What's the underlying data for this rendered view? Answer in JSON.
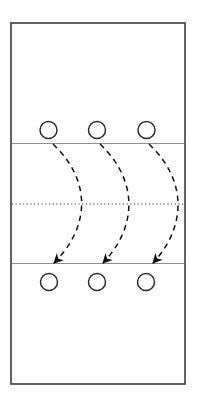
{
  "diagram": {
    "kind": "court-movement-diagram",
    "background": "#ffffff",
    "canvas": {
      "width": 197,
      "height": 402
    },
    "court": {
      "x": 11,
      "y": 23,
      "width": 174,
      "height": 361,
      "stroke": "#3b3b3b",
      "stroke_width": 1.6,
      "fill": "#ffffff"
    },
    "lines": [
      {
        "name": "upper-attack-line",
        "x1": 11.8,
        "y1": 143.5,
        "x2": 184.2,
        "y2": 143.5,
        "stroke": "#8f8f8f",
        "width": 1.2,
        "style": "solid"
      },
      {
        "name": "center-net-line",
        "x1": 11.8,
        "y1": 204,
        "x2": 184.2,
        "y2": 204,
        "stroke": "#4a4a4a",
        "width": 1.2,
        "style": "dotted",
        "dash": "1.3 2.4"
      },
      {
        "name": "lower-attack-line",
        "x1": 11.8,
        "y1": 263.5,
        "x2": 184.2,
        "y2": 263.5,
        "stroke": "#8f8f8f",
        "width": 1.2,
        "style": "solid"
      }
    ],
    "player_style": {
      "r": 8.5,
      "stroke": "#2d2d2d",
      "stroke_width": 1.5,
      "fill": "#ffffff"
    },
    "players_top": [
      {
        "name": "player-top-1",
        "cx": 48.5,
        "cy": 130
      },
      {
        "name": "player-top-2",
        "cx": 97,
        "cy": 130
      },
      {
        "name": "player-top-3",
        "cx": 146.5,
        "cy": 130
      }
    ],
    "players_bottom": [
      {
        "name": "player-bottom-1",
        "cx": 49,
        "cy": 282
      },
      {
        "name": "player-bottom-2",
        "cx": 97,
        "cy": 282
      },
      {
        "name": "player-bottom-3",
        "cx": 146,
        "cy": 282
      }
    ],
    "arrow_style": {
      "stroke": "#101010",
      "stroke_width": 1.5,
      "dash": "5.5 4.5",
      "head_fill": "#101010",
      "head_path": "M 1 1 L 11 6 L 1 11 L 4 6 Z"
    },
    "arrows": [
      {
        "name": "movement-arrow-1",
        "path": "M 53 144 C 91 180, 91 226, 54 263"
      },
      {
        "name": "movement-arrow-2",
        "path": "M 100 144 C 138 180, 138 226, 103 263"
      },
      {
        "name": "movement-arrow-3",
        "path": "M 149 144 C 187 180, 187 226, 153 263"
      }
    ]
  }
}
